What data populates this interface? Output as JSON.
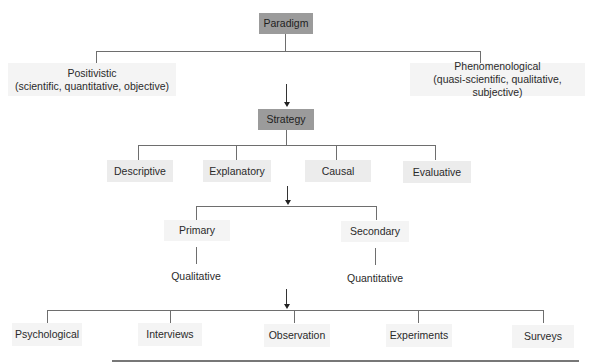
{
  "diagram": {
    "level1": {
      "label": "Paradigm"
    },
    "paradigm_options": [
      {
        "label": "Positivistic",
        "sublabel": "(scientific, quantitative, objective)"
      },
      {
        "label": "Phenomenological",
        "sublabel": "(quasi-scientific, qualitative, subjective)"
      }
    ],
    "level2": {
      "label": "Strategy"
    },
    "strategy_options": [
      {
        "label": "Descriptive"
      },
      {
        "label": "Explanatory"
      },
      {
        "label": "Causal"
      },
      {
        "label": "Evaluative"
      }
    ],
    "data_sources": [
      {
        "label": "Primary",
        "type": "Qualitative"
      },
      {
        "label": "Secondary",
        "type": "Quantitative"
      }
    ],
    "methods": [
      {
        "label": "Psychological"
      },
      {
        "label": "Interviews"
      },
      {
        "label": "Observation"
      },
      {
        "label": "Experiments"
      },
      {
        "label": "Surveys"
      }
    ],
    "colors": {
      "primary_node": "#9b9b9b",
      "secondary_node": "#ececec",
      "connector": "#6e6e6e"
    }
  }
}
